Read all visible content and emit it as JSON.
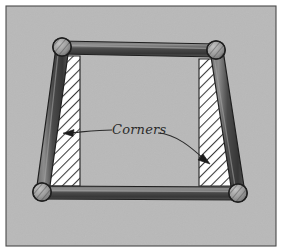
{
  "figure": {
    "title": "Corners",
    "canvas": {
      "width": 282,
      "height": 252
    },
    "background_color": "#b9b9b9",
    "paper_color": "#ffffff",
    "border": {
      "frame_color": "#4a4a4a",
      "frame_width": 1,
      "inset": 6
    }
  },
  "annotation": {
    "label": "Corners",
    "label_x": 112,
    "label_y": 134,
    "leader_color": "#2b2b2b",
    "arrow_color": "#1b1b1b",
    "arrowheads": [
      {
        "name": "left-arrowhead",
        "tip_x": 64,
        "tip_y": 133,
        "direction": "left"
      },
      {
        "name": "right-arrowhead",
        "tip_x": 209,
        "tip_y": 163,
        "direction": "down-right"
      }
    ]
  },
  "frame": {
    "rail_color_dark": "#3e3e3e",
    "rail_color_mid": "#5d5d5d",
    "rail_color_light": "#8a8a8a",
    "rail_outline": "#222222",
    "ball_fill": "#9a9a9a",
    "ball_outline": "#1f1f1f",
    "hatch_fill": "#ffffff",
    "hatch_line_color": "#333333",
    "corners": [
      {
        "name": "corner-top-left",
        "x": 62,
        "y": 47,
        "r": 9
      },
      {
        "name": "corner-top-right",
        "x": 216,
        "y": 50,
        "r": 9
      },
      {
        "name": "corner-bottom-left",
        "x": 42,
        "y": 192,
        "r": 9
      },
      {
        "name": "corner-bottom-right",
        "x": 238,
        "y": 193,
        "r": 9
      }
    ],
    "rails": [
      {
        "name": "rail-top",
        "from": "corner-top-left",
        "to": "corner-top-right"
      },
      {
        "name": "rail-bottom",
        "from": "corner-bottom-left",
        "to": "corner-bottom-right"
      },
      {
        "name": "rail-left",
        "from": "corner-top-left",
        "to": "corner-bottom-left"
      },
      {
        "name": "rail-right",
        "from": "corner-top-right",
        "to": "corner-bottom-right"
      }
    ],
    "hatched_regions": [
      {
        "name": "hatched-corner-left",
        "side": "left"
      },
      {
        "name": "hatched-corner-right",
        "side": "right"
      }
    ]
  }
}
